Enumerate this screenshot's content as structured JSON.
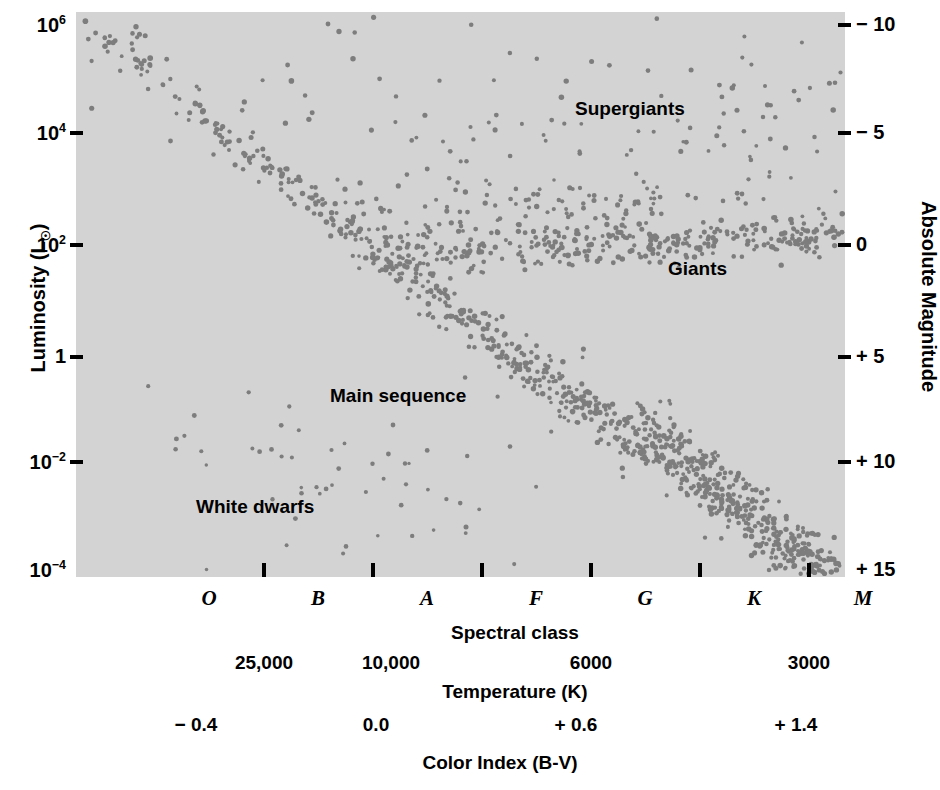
{
  "chart_data": {
    "type": "scatter",
    "xlabel": "Spectral class",
    "ylabel": "Luminosity (L☉)",
    "grid": false,
    "legend_position": "none",
    "axes": {
      "left": {
        "label": "Luminosity (L☉)",
        "scale": "log",
        "ticks": [
          {
            "text": "10",
            "exp": "6",
            "value": 1000000,
            "y": 25
          },
          {
            "text": "10",
            "exp": "4",
            "value": 10000,
            "y": 133
          },
          {
            "text": "10",
            "exp": "2",
            "value": 100,
            "y": 245
          },
          {
            "text": "1",
            "exp": "",
            "value": 1,
            "y": 357
          },
          {
            "text": "10",
            "exp": "-2",
            "value": 0.01,
            "y": 462
          },
          {
            "text": "10",
            "exp": "-4",
            "value": 0.0001,
            "y": 570
          }
        ],
        "range": [
          0.0001,
          1000000
        ]
      },
      "right": {
        "label": "Absolute Magnitude",
        "ticks": [
          {
            "text": "− 10",
            "value": -10,
            "y": 25
          },
          {
            "text": "− 5",
            "value": -5,
            "y": 133
          },
          {
            "text": "0",
            "value": 0,
            "y": 245
          },
          {
            "text": "+ 5",
            "value": 5,
            "y": 357
          },
          {
            "text": "+ 10",
            "value": 10,
            "y": 462
          },
          {
            "text": "+ 15",
            "value": 15,
            "y": 570
          }
        ],
        "range": [
          -10,
          15
        ]
      },
      "bottom": {
        "spectral_label": "Spectral class",
        "spectral_classes": [
          {
            "label": "O",
            "x": 133
          },
          {
            "label": "B",
            "x": 242
          },
          {
            "label": "A",
            "x": 351
          },
          {
            "label": "F",
            "x": 460
          },
          {
            "label": "G",
            "x": 569
          },
          {
            "label": "K",
            "x": 678
          },
          {
            "label": "M",
            "x": 787
          }
        ],
        "spectral_tick_x": [
          188,
          297,
          406,
          515,
          624,
          733
        ],
        "temperature_label": "Temperature (K)",
        "temperature_ticks": [
          {
            "label": "25,000",
            "x": 188
          },
          {
            "label": "10,000",
            "x": 315
          },
          {
            "label": "6000",
            "x": 515
          },
          {
            "label": "3000",
            "x": 733
          }
        ],
        "color_index_label": "Color Index (B-V)",
        "color_index_ticks": [
          {
            "label": "− 0.4",
            "x": 120
          },
          {
            "label": "0.0",
            "x": 300
          },
          {
            "label": "+ 0.6",
            "x": 500
          },
          {
            "label": "+ 1.4",
            "x": 720
          }
        ]
      }
    },
    "annotations": [
      {
        "text": "Supergiants",
        "x": 575,
        "y": 98,
        "region": "supergiants"
      },
      {
        "text": "Giants",
        "x": 668,
        "y": 258,
        "region": "giants"
      },
      {
        "text": "Main sequence",
        "x": 330,
        "y": 385,
        "region": "main-sequence"
      },
      {
        "text": "White dwarfs",
        "x": 196,
        "y": 496,
        "region": "white-dwarfs"
      }
    ],
    "populations": [
      {
        "name": "main sequence",
        "description": "Diagonal band from hot/luminous upper-left to cool/faint lower-right",
        "count": 620,
        "point_color": "#7d7d7d"
      },
      {
        "name": "giants",
        "description": "Horizontal clump near L = 100 L_sun spanning spectral classes G through M",
        "count": 300,
        "point_color": "#7d7d7d"
      },
      {
        "name": "supergiants",
        "description": "Sparse scatter across the top of the diagram above L = 10,000 L_sun",
        "count": 45,
        "point_color": "#7d7d7d"
      },
      {
        "name": "white dwarfs",
        "description": "Sparse scatter in the lower-left, below L = 0.01 L_sun",
        "count": 30,
        "point_color": "#7d7d7d"
      }
    ]
  },
  "colors": {
    "plot_background": "#d3d3d3",
    "page_background": "#ffffff",
    "star_point": "#7d7d7d",
    "axis": "#000000",
    "text": "#000000"
  },
  "plot_geometry": {
    "left": 76,
    "top": 12,
    "width": 769,
    "height": 565
  }
}
